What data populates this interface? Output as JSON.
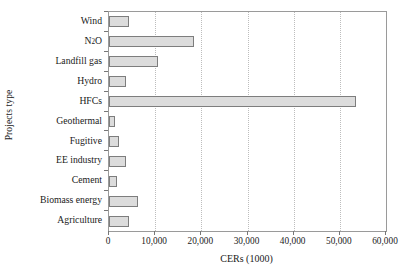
{
  "chart_data": {
    "type": "bar",
    "orientation": "horizontal",
    "title": "",
    "xlabel": "CERs (1000)",
    "ylabel": "Projects type",
    "categories": [
      "Wind",
      "N2O",
      "Landfill gas",
      "Hydro",
      "HFCs",
      "Geothermal",
      "Fugitive",
      "EE industry",
      "Cement",
      "Biomass energy",
      "Agriculture"
    ],
    "category_labels_html": [
      "Wind",
      "N<sub>2</sub>O",
      "Landfill gas",
      "Hydro",
      "HFCs",
      "Geothermal",
      "Fugitive",
      "EE industry",
      "Cement",
      "Biomass energy",
      "Agriculture"
    ],
    "values": [
      4300,
      18500,
      10600,
      3700,
      53500,
      1300,
      2200,
      3700,
      1700,
      6300,
      4300
    ],
    "xlim": [
      0,
      60000
    ],
    "xticks": [
      0,
      10000,
      20000,
      30000,
      40000,
      50000,
      60000
    ],
    "xtick_labels": [
      "0",
      "10,000",
      "20,000",
      "30,000",
      "40,000",
      "50,000",
      "60,000"
    ],
    "grid": "vertical-dotted",
    "legend": "none",
    "bar_fill_color": "#dcdcdc",
    "bar_border_color": "#7d7d7d",
    "axis_color": "#9a9a9a",
    "gridline_color": "#bdbdbd",
    "background_color": "#ffffff"
  }
}
